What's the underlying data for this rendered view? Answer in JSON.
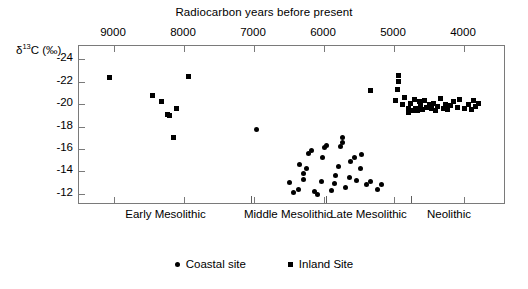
{
  "chart_data": {
    "type": "scatter",
    "title": "Radiocarbon years before present",
    "xlabel": "Radiocarbon years before present",
    "ylabel": "δ¹³C (‰)",
    "xlim": [
      9500,
      3400
    ],
    "ylim": [
      -25.2,
      -11.0
    ],
    "x_reversed": true,
    "grid": false,
    "legend_position": "bottom-center",
    "xticks": [
      9000,
      8000,
      7000,
      6000,
      5000,
      4000
    ],
    "xtick_labels": [
      "9000",
      "8000",
      "7000",
      "6000",
      "5000",
      "4000"
    ],
    "yticks": [
      -12,
      -14,
      -16,
      -18,
      -20,
      -22,
      -24
    ],
    "ytick_labels": [
      "-12",
      "-14",
      "-16",
      "-18",
      "-20",
      "-22",
      "-24"
    ],
    "period_boundaries": [
      7040,
      5970,
      4760
    ],
    "periods": [
      {
        "label": "Early Mesolithic",
        "center_x": 8250
      },
      {
        "label": "Middle Mesolithic",
        "center_x": 6500
      },
      {
        "label": "Late Mesolithic",
        "center_x": 5350
      },
      {
        "label": "Neolithic",
        "center_x": 4200
      }
    ],
    "series": [
      {
        "name": "Coastal site",
        "marker": "circle",
        "color": "#000000",
        "points": [
          [
            6960,
            -17.7
          ],
          [
            6500,
            -13.0
          ],
          [
            6440,
            -12.1
          ],
          [
            6370,
            -12.4
          ],
          [
            6345,
            -14.6
          ],
          [
            6300,
            -13.3
          ],
          [
            6290,
            -13.8
          ],
          [
            6250,
            -14.3
          ],
          [
            6225,
            -15.6
          ],
          [
            6180,
            -15.9
          ],
          [
            6140,
            -12.2
          ],
          [
            6100,
            -11.9
          ],
          [
            6030,
            -13.1
          ],
          [
            6020,
            -15.2
          ],
          [
            5990,
            -16.1
          ],
          [
            5960,
            -16.3
          ],
          [
            5900,
            -12.3
          ],
          [
            5855,
            -12.9
          ],
          [
            5840,
            -13.6
          ],
          [
            5800,
            -14.4
          ],
          [
            5770,
            -16.2
          ],
          [
            5740,
            -16.6
          ],
          [
            5735,
            -17.0
          ],
          [
            5690,
            -12.6
          ],
          [
            5640,
            -13.5
          ],
          [
            5620,
            -14.9
          ],
          [
            5570,
            -15.2
          ],
          [
            5530,
            -13.2
          ],
          [
            5480,
            -14.3
          ],
          [
            5460,
            -15.5
          ],
          [
            5390,
            -12.8
          ],
          [
            5330,
            -13.1
          ],
          [
            5230,
            -12.4
          ],
          [
            5180,
            -12.8
          ]
        ]
      },
      {
        "name": "Inland Site",
        "marker": "square",
        "color": "#000000",
        "points": [
          [
            9060,
            -22.4
          ],
          [
            8450,
            -20.8
          ],
          [
            8320,
            -20.2
          ],
          [
            8240,
            -19.1
          ],
          [
            8210,
            -19.0
          ],
          [
            8150,
            -17.0
          ],
          [
            8110,
            -19.6
          ],
          [
            7930,
            -22.5
          ],
          [
            5340,
            -21.2
          ],
          [
            4980,
            -20.3
          ],
          [
            4950,
            -21.3
          ],
          [
            4940,
            -22.0
          ],
          [
            4930,
            -22.6
          ],
          [
            4880,
            -20.0
          ],
          [
            4850,
            -20.6
          ],
          [
            4800,
            -19.6
          ],
          [
            4790,
            -19.3
          ],
          [
            4760,
            -20.1
          ],
          [
            4735,
            -19.4
          ],
          [
            4710,
            -20.4
          ],
          [
            4690,
            -19.6
          ],
          [
            4660,
            -19.4
          ],
          [
            4640,
            -20.2
          ],
          [
            4620,
            -19.9
          ],
          [
            4590,
            -19.5
          ],
          [
            4560,
            -20.3
          ],
          [
            4530,
            -19.7
          ],
          [
            4500,
            -20.0
          ],
          [
            4470,
            -19.6
          ],
          [
            4440,
            -20.1
          ],
          [
            4410,
            -19.4
          ],
          [
            4380,
            -19.8
          ],
          [
            4340,
            -20.5
          ],
          [
            4300,
            -19.6
          ],
          [
            4270,
            -20.0
          ],
          [
            4230,
            -19.5
          ],
          [
            4190,
            -19.9
          ],
          [
            4150,
            -20.2
          ],
          [
            4100,
            -19.7
          ],
          [
            4060,
            -20.4
          ],
          [
            3990,
            -19.6
          ],
          [
            3940,
            -20.0
          ],
          [
            3900,
            -19.5
          ],
          [
            3860,
            -20.3
          ],
          [
            3840,
            -19.8
          ],
          [
            3790,
            -20.1
          ]
        ]
      }
    ]
  }
}
